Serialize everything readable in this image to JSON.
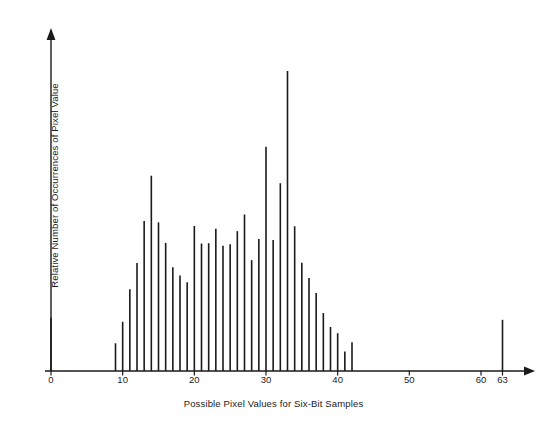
{
  "chart_data": {
    "type": "bar",
    "title": "",
    "subtitle": "",
    "xlabel": "Possible Pixel Values for Six-Bit Samples",
    "ylabel": "Relative Number of Occurrences of Pixel Value",
    "xlim": [
      0,
      66
    ],
    "ylim": [
      0,
      1.0
    ],
    "grid": false,
    "legend": null,
    "annotations": [],
    "axis_style": "arrow-tipped axes, bars as thin vertical lines",
    "line_color": "#1a1a1a",
    "xticks": [
      0,
      10,
      20,
      30,
      40,
      50,
      60,
      63
    ],
    "xtick_labels": [
      "0",
      "10",
      "20",
      "30",
      "40",
      "50",
      "60",
      "63"
    ],
    "yticks": [],
    "ytick_labels": [],
    "categories": [
      0,
      1,
      2,
      3,
      4,
      5,
      6,
      7,
      8,
      9,
      10,
      11,
      12,
      13,
      14,
      15,
      16,
      17,
      18,
      19,
      20,
      21,
      22,
      23,
      24,
      25,
      26,
      27,
      28,
      29,
      30,
      31,
      32,
      33,
      34,
      35,
      36,
      37,
      38,
      39,
      40,
      41,
      42,
      43,
      44,
      45,
      46,
      47,
      48,
      49,
      50,
      51,
      52,
      53,
      54,
      55,
      56,
      57,
      58,
      59,
      60,
      61,
      62,
      63
    ],
    "values": [
      0.163,
      0,
      0,
      0,
      0,
      0,
      0,
      0,
      0,
      0.085,
      0.151,
      0.251,
      0.331,
      0.46,
      0.599,
      0.456,
      0.393,
      0.318,
      0.293,
      0.272,
      0.445,
      0.391,
      0.392,
      0.436,
      0.384,
      0.389,
      0.429,
      0.48,
      0.34,
      0.405,
      0.688,
      0.402,
      0.576,
      0.92,
      0.444,
      0.332,
      0.285,
      0.239,
      0.178,
      0.135,
      0.116,
      0.06,
      0.088,
      0,
      0,
      0,
      0,
      0,
      0,
      0,
      0,
      0,
      0,
      0,
      0,
      0,
      0,
      0,
      0,
      0,
      0,
      0,
      0,
      0.157
    ]
  },
  "axes": {
    "x_axis_name": "x-axis",
    "y_axis_name": "y-axis"
  }
}
